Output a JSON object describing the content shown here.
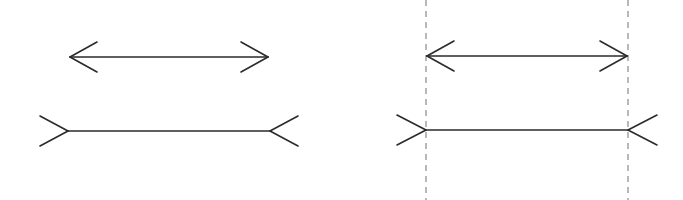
{
  "figure": {
    "colors": {
      "background": "#ffffff",
      "stroke": "#2b2b2b",
      "guide": "#8a8a8a"
    },
    "panels": [
      {
        "id": "left",
        "shapes": [
          {
            "type": "arrows-out",
            "x1": 70,
            "x2": 268,
            "y": 57,
            "head_len": 27,
            "head_half": 15
          },
          {
            "type": "fins-in",
            "x1": 68,
            "x2": 270,
            "y": 131,
            "fin_len": 28,
            "fin_half": 15
          }
        ],
        "guides": []
      },
      {
        "id": "right",
        "shapes": [
          {
            "type": "arrows-out",
            "x1": 427,
            "x2": 627,
            "y": 56,
            "head_len": 27,
            "head_half": 15
          },
          {
            "type": "fins-in",
            "x1": 426,
            "x2": 628,
            "y": 130,
            "fin_len": 29,
            "fin_half": 15
          }
        ],
        "guides": [
          {
            "x": 426,
            "y1": 0,
            "y2": 200
          },
          {
            "x": 628,
            "y1": 0,
            "y2": 200
          }
        ]
      }
    ]
  }
}
